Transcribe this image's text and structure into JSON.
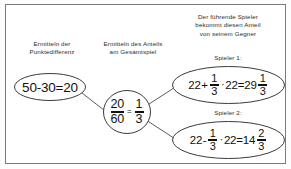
{
  "diagram": {
    "type": "flow-diagram",
    "language": "de",
    "border_color": "#7a7a7a",
    "background": "#ffffff",
    "text_color": "#2b2b2b",
    "captions": {
      "left": "Ermitteln der\nPunktedifferenz",
      "middle": "Ermitteln des Anteils\nam Gesamtspiel",
      "right": "Der führende Spieler\nbekommt diesen Anteil\nvon seinem Gegner"
    },
    "sublabels": {
      "player1": "Spieler 1:",
      "player2": "Spieler 2:"
    },
    "nodes": {
      "difference": {
        "shape": "ellipse",
        "expression": "50-30=20",
        "minuend": "50",
        "subtrahend": "30",
        "result": "20"
      },
      "share": {
        "shape": "ellipse",
        "fraction_left_numerator": "20",
        "fraction_left_denominator": "60",
        "equals": "=",
        "fraction_right_numerator": "1",
        "fraction_right_denominator": "3"
      },
      "player1_result": {
        "shape": "ellipse",
        "base": "22",
        "operator": "+",
        "factor_numerator": "1",
        "factor_denominator": "3",
        "multiply": "·",
        "multiplicand": "22",
        "equals": "=",
        "result_whole": "29",
        "result_numerator": "1",
        "result_denominator": "3"
      },
      "player2_result": {
        "shape": "ellipse",
        "base": "22",
        "operator": "-",
        "factor_numerator": "1",
        "factor_denominator": "3",
        "multiply": "·",
        "multiplicand": "22",
        "equals": "=",
        "result_whole": "14",
        "result_numerator": "2",
        "result_denominator": "3"
      }
    }
  }
}
